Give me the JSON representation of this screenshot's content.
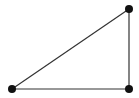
{
  "diagram": {
    "type": "right-triangle",
    "background": "#ffffff",
    "line_color": "#333333",
    "vertex_color": "#111111",
    "vertices": [
      {
        "id": "A",
        "x": 12,
        "y": 89,
        "r": 4
      },
      {
        "id": "B",
        "x": 129,
        "y": 89,
        "r": 4
      },
      {
        "id": "C",
        "x": 129,
        "y": 9,
        "r": 4
      }
    ],
    "edges": [
      {
        "from": "A",
        "to": "B"
      },
      {
        "from": "B",
        "to": "C"
      },
      {
        "from": "C",
        "to": "A"
      }
    ]
  }
}
